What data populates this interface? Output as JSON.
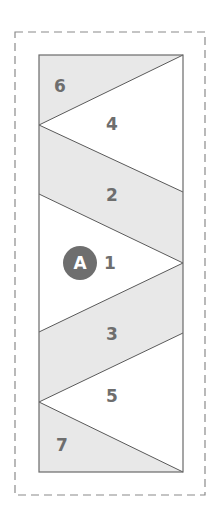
{
  "diagram": {
    "type": "foundation-paper-piecing-template",
    "colors": {
      "shaded": "#e8e8e8",
      "unshaded": "#ffffff",
      "line": "#5a5a5a",
      "seam_allowance": "#8a8a8a",
      "label": "#6e6e6e",
      "badge_fill": "#6e6e6e",
      "badge_text": "#ffffff"
    },
    "section_badge": "A",
    "pieces": [
      {
        "label": "6",
        "shaded": true
      },
      {
        "label": "4",
        "shaded": false
      },
      {
        "label": "2",
        "shaded": true
      },
      {
        "label": "1",
        "shaded": false
      },
      {
        "label": "3",
        "shaded": true
      },
      {
        "label": "5",
        "shaded": false
      },
      {
        "label": "7",
        "shaded": true
      }
    ]
  }
}
